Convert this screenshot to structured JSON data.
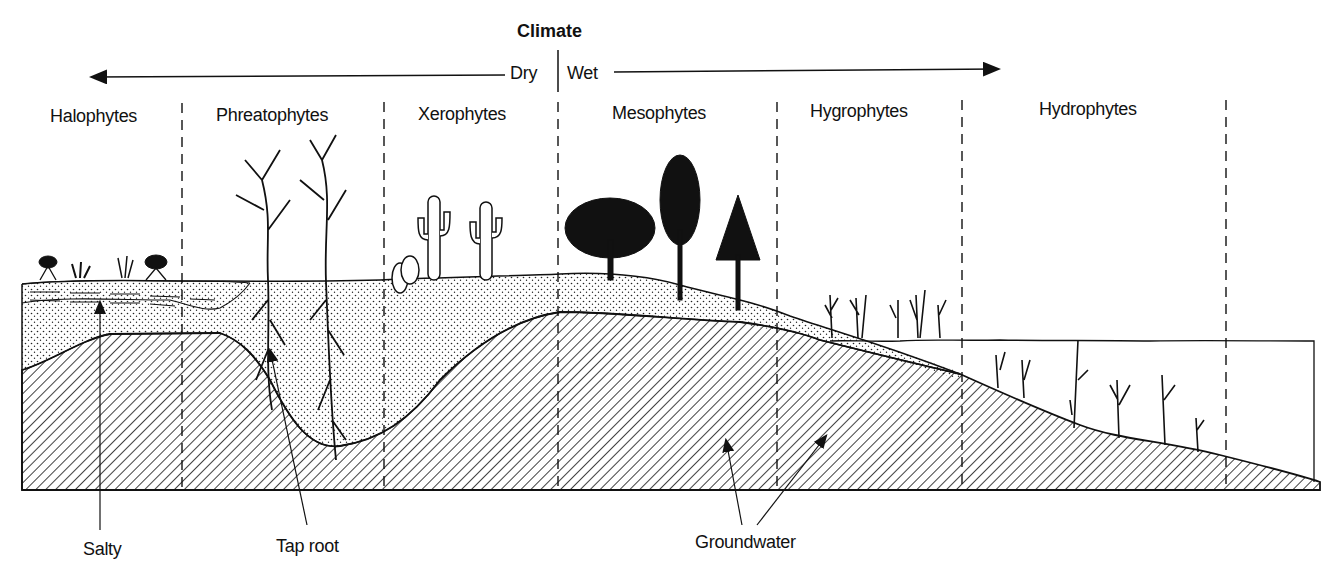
{
  "title": "Climate",
  "climate_axis": {
    "dry_label": "Dry",
    "wet_label": "Wet"
  },
  "zones": [
    {
      "label": "Halophytes"
    },
    {
      "label": "Phreatophytes"
    },
    {
      "label": "Xerophytes"
    },
    {
      "label": "Mesophytes"
    },
    {
      "label": "Hygrophytes"
    },
    {
      "label": "Hydrophytes"
    }
  ],
  "callouts": {
    "salty": "Salty",
    "tap_root": "Tap root",
    "groundwater": "Groundwater"
  },
  "legend_patterns": {
    "dotted": "soil / sediment",
    "hatched": "bedrock",
    "dashed_layer": "salty layer",
    "water": "surface water"
  },
  "colors": {
    "ink": "#111111",
    "background": "#ffffff"
  }
}
